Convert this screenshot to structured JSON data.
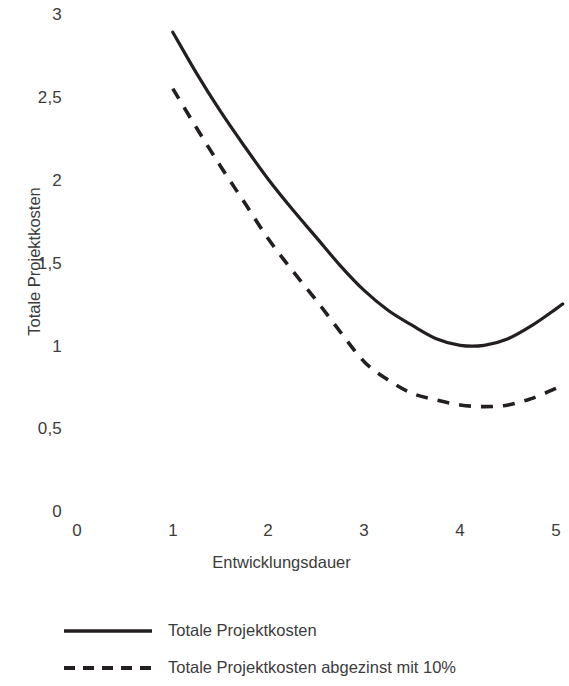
{
  "chart_data": {
    "type": "line",
    "title": "",
    "xlabel": "Entwicklungsdauer",
    "ylabel": "Totale Projektkosten",
    "xlim": [
      0,
      5.07
    ],
    "ylim": [
      0,
      3
    ],
    "grid": false,
    "legend_position": "bottom-left",
    "x_ticks": [
      "0",
      "1",
      "2",
      "3",
      "4",
      "5"
    ],
    "x_tick_values": [
      0,
      1,
      2,
      3,
      4,
      5
    ],
    "y_ticks": [
      "0",
      "0,5",
      "1",
      "1,5",
      "2",
      "2,5",
      "3"
    ],
    "y_tick_values": [
      0,
      0.5,
      1,
      1.5,
      2,
      2.5,
      3
    ],
    "x": [
      1.0,
      1.25,
      1.5,
      1.75,
      2.0,
      2.25,
      2.5,
      2.75,
      3.0,
      3.25,
      3.5,
      3.75,
      4.0,
      4.25,
      4.5,
      4.75,
      5.0,
      5.07
    ],
    "series": [
      {
        "name": "Totale Projektkosten",
        "style": "solid",
        "color": "#231f20",
        "values": [
          2.89,
          2.64,
          2.41,
          2.2,
          2.0,
          1.82,
          1.65,
          1.48,
          1.33,
          1.21,
          1.12,
          1.04,
          1.0,
          1.0,
          1.04,
          1.12,
          1.22,
          1.25
        ]
      },
      {
        "name": "Totale Projektkosten abgezinst mit 10%",
        "style": "dashed",
        "color": "#231f20",
        "values": [
          2.55,
          2.31,
          2.08,
          1.86,
          1.64,
          1.45,
          1.27,
          1.08,
          0.9,
          0.79,
          0.71,
          0.67,
          0.64,
          0.63,
          0.64,
          0.68,
          0.74,
          0.76
        ]
      }
    ]
  },
  "axes": {
    "y_title": "Totale Projektkosten",
    "x_title": "Entwicklungsdauer"
  },
  "legend": {
    "items": [
      {
        "label": "Totale Projektkosten",
        "style": "solid"
      },
      {
        "label": "Totale Projektkosten abgezinst mit 10%",
        "style": "dashed"
      }
    ]
  }
}
